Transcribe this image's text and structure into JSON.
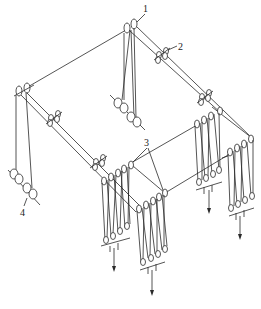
{
  "diagram": {
    "type": "isometric rope-and-pulley lifting system",
    "labels": [
      {
        "id": "1",
        "text": "1",
        "x": 146,
        "y": 13,
        "target": "top crown pulleys"
      },
      {
        "id": "2",
        "text": "2",
        "x": 180,
        "y": 49,
        "target": "intermediate guide pulleys on beam"
      },
      {
        "id": "3",
        "text": "3",
        "x": 146,
        "y": 145,
        "target": "diverting pulleys at pulley-block groups"
      },
      {
        "id": "4",
        "text": "4",
        "x": 21,
        "y": 214,
        "target": "winch drums"
      }
    ],
    "components": {
      "winch_drum_pairs": 2,
      "pulley_block_groups": 4,
      "load_arrows": 4
    },
    "colors": {
      "line": "#2a2a2a",
      "background": "#ffffff"
    }
  }
}
